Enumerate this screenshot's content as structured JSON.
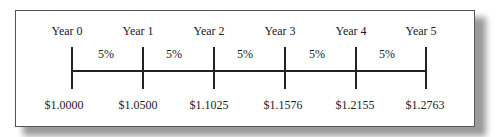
{
  "timeline": {
    "years": [
      "Year 0",
      "Year 1",
      "Year 2",
      "Year 3",
      "Year 4",
      "Year 5"
    ],
    "rates": [
      "5%",
      "5%",
      "5%",
      "5%",
      "5%"
    ],
    "values": [
      "$1.0000",
      "$1.0500",
      "$1.1025",
      "$1.1576",
      "$1.2155",
      "$1.2763"
    ]
  }
}
